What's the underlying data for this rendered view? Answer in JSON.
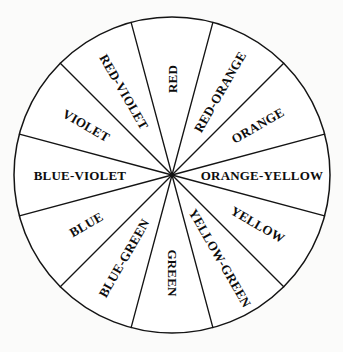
{
  "diagram": {
    "type": "color-wheel",
    "shape": "circle",
    "sector_count": 12,
    "sector_angle_degrees": 30,
    "label_orientation": "radial-outward",
    "colors": {
      "background": "#fbfbfa",
      "wheel_fill": "#ffffff",
      "line": "#141414",
      "text": "#0d0d0d"
    },
    "geometry": {
      "center_x": 172,
      "center_y": 175,
      "radius": 158
    },
    "sectors": [
      {
        "label": "RED",
        "start_angle": -15,
        "end_angle": 15,
        "mid_angle": 0,
        "label_radius": 96,
        "font_size": 13
      },
      {
        "label": "RED-ORANGE",
        "start_angle": 15,
        "end_angle": 45,
        "mid_angle": 30,
        "label_radius": 96,
        "font_size": 13
      },
      {
        "label": "ORANGE",
        "start_angle": 45,
        "end_angle": 75,
        "mid_angle": 60,
        "label_radius": 99,
        "font_size": 13
      },
      {
        "label": "ORANGE-YELLOW",
        "start_angle": 75,
        "end_angle": 105,
        "mid_angle": 90,
        "label_radius": 90,
        "font_size": 13
      },
      {
        "label": "YELLOW",
        "start_angle": 105,
        "end_angle": 135,
        "mid_angle": 120,
        "label_radius": 99,
        "font_size": 13
      },
      {
        "label": "YELLOW-GREEN",
        "start_angle": 135,
        "end_angle": 165,
        "mid_angle": 150,
        "label_radius": 96,
        "font_size": 13
      },
      {
        "label": "GREEN",
        "start_angle": 165,
        "end_angle": 195,
        "mid_angle": 180,
        "label_radius": 98,
        "font_size": 13
      },
      {
        "label": "BLUE-GREEN",
        "start_angle": 195,
        "end_angle": 225,
        "mid_angle": 210,
        "label_radius": 96,
        "font_size": 13
      },
      {
        "label": "BLUE",
        "start_angle": 225,
        "end_angle": 255,
        "mid_angle": 240,
        "label_radius": 99,
        "font_size": 13
      },
      {
        "label": "BLUE-VIOLET",
        "start_angle": 255,
        "end_angle": 285,
        "mid_angle": 270,
        "label_radius": 92,
        "font_size": 13
      },
      {
        "label": "VIOLET",
        "start_angle": 285,
        "end_angle": 315,
        "mid_angle": 300,
        "label_radius": 99,
        "font_size": 13
      },
      {
        "label": "RED-VIOLET",
        "start_angle": 315,
        "end_angle": 345,
        "mid_angle": 330,
        "label_radius": 96,
        "font_size": 13
      }
    ]
  }
}
